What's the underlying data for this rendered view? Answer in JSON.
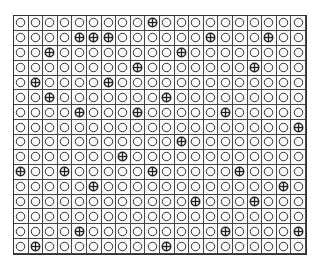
{
  "grid": {
    "rows": 16,
    "cols": 20,
    "empty_symbol": "circle-icon",
    "marked_symbol": "circle-plus-icon",
    "line_color": "#444444",
    "symbol_color": "#222222",
    "marked": [
      [
        9
      ],
      [
        4,
        5,
        6,
        13,
        17
      ],
      [
        2,
        11
      ],
      [
        8,
        16
      ],
      [
        1,
        6
      ],
      [
        2,
        10
      ],
      [
        4,
        8,
        14
      ],
      [
        19
      ],
      [
        11
      ],
      [
        7
      ],
      [
        0,
        3,
        9,
        15
      ],
      [
        5,
        18
      ],
      [
        12,
        16
      ],
      [],
      [
        4,
        14,
        19
      ],
      [
        1,
        10
      ]
    ]
  }
}
